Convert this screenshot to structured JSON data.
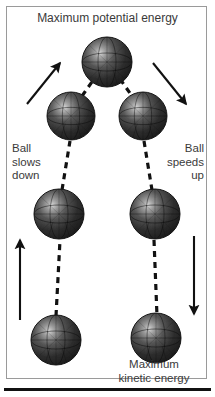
{
  "figure": {
    "title": "Maximum potential energy",
    "labels": {
      "left": "Ball\nslows\ndown",
      "right": "Ball\nspeeds\nup",
      "bottom": "Maximum\nkinetic energy"
    },
    "colors": {
      "text": "#3a3a3a",
      "frame": "#9a9a9a",
      "ball_dark": "#2b2b2b",
      "ball_highlight": "#cfcfcf",
      "line": "#111111",
      "background": "#ffffff"
    }
  },
  "diagram_data": {
    "type": "physics-trajectory",
    "description": "Ball travelling along an arc: slowing on the way up on the left, speeding up on the way down on the right",
    "balls": [
      {
        "id": "ball-bottom-left",
        "cx": 56,
        "cy": 340,
        "r": 25
      },
      {
        "id": "ball-mid-left",
        "cx": 59,
        "cy": 214,
        "r": 25
      },
      {
        "id": "ball-upper-left",
        "cx": 71,
        "cy": 116,
        "r": 24
      },
      {
        "id": "ball-apex",
        "cx": 107,
        "cy": 62,
        "r": 25
      },
      {
        "id": "ball-upper-right",
        "cx": 143,
        "cy": 116,
        "r": 24
      },
      {
        "id": "ball-mid-right",
        "cx": 155,
        "cy": 214,
        "r": 25
      },
      {
        "id": "ball-bottom-right",
        "cx": 156,
        "cy": 338,
        "r": 25
      }
    ],
    "dashed_path": [
      {
        "id": "path-bottom-left-to-mid-left",
        "x1": 56,
        "y1": 316,
        "x2": 60,
        "y2": 240
      },
      {
        "id": "path-mid-left-to-upper-left",
        "x1": 62,
        "y1": 190,
        "x2": 70,
        "y2": 141
      },
      {
        "id": "path-upper-left-to-apex",
        "x1": 82,
        "y1": 96,
        "x2": 94,
        "y2": 79
      },
      {
        "id": "path-apex-to-upper-right",
        "x1": 120,
        "y1": 79,
        "x2": 132,
        "y2": 96
      },
      {
        "id": "path-upper-right-to-mid-right",
        "x1": 144,
        "y1": 141,
        "x2": 152,
        "y2": 190
      },
      {
        "id": "path-mid-right-to-bottom-right",
        "x1": 154,
        "y1": 240,
        "x2": 157,
        "y2": 316
      }
    ],
    "arrows": [
      {
        "id": "arrow-up-left-diagonal",
        "x1": 27,
        "y1": 104,
        "x2": 60,
        "y2": 62,
        "direction": "up-right"
      },
      {
        "id": "arrow-down-right-diagonal",
        "x1": 153,
        "y1": 62,
        "x2": 187,
        "y2": 104,
        "direction": "down-right"
      },
      {
        "id": "arrow-up-left-vertical",
        "x1": 20,
        "y1": 320,
        "x2": 20,
        "y2": 239,
        "direction": "up"
      },
      {
        "id": "arrow-down-right-vertical",
        "x1": 194,
        "y1": 236,
        "x2": 194,
        "y2": 315,
        "direction": "down"
      }
    ]
  }
}
